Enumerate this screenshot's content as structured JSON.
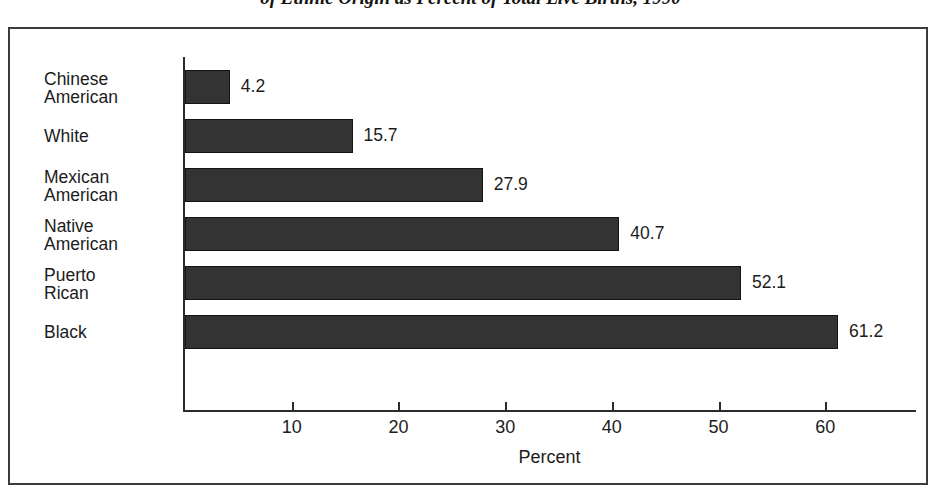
{
  "figure": {
    "title": "of Ethnic Origin as Percent of Total Live Births, 1990",
    "frame_color": "#3b3b3b"
  },
  "chart_data": {
    "type": "bar",
    "orientation": "horizontal",
    "title": "of Ethnic Origin as Percent of Total Live Births, 1990",
    "categories": [
      "Chinese\nAmerican",
      "White",
      "Mexican\nAmerican",
      "Native\nAmerican",
      "Puerto\nRican",
      "Black"
    ],
    "values": [
      4.2,
      15.7,
      27.9,
      40.7,
      52.1,
      61.2
    ],
    "value_labels": [
      "4.2",
      "15.7",
      "27.9",
      "40.7",
      "52.1",
      "61.2"
    ],
    "xlabel": "Percent",
    "ylabel": "",
    "xticks": [
      10,
      20,
      30,
      40,
      50,
      60
    ],
    "xtick_labels": [
      "10",
      "20",
      "30",
      "40",
      "50",
      "60"
    ],
    "xlim": [
      0,
      68.5
    ],
    "grid": false,
    "legend": null,
    "bar_color": "#333333",
    "bar_edge_color": "#141414"
  }
}
